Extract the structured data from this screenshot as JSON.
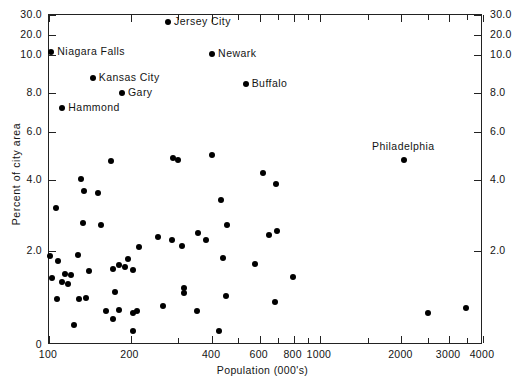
{
  "chart_data": {
    "type": "scatter",
    "title": "",
    "xlabel": "Population (000's)",
    "ylabel": "Percent of city area",
    "xscale": "log",
    "xlim": [
      100,
      4000
    ],
    "ylim": [
      0,
      30
    ],
    "grid": false,
    "legend": null,
    "x_ticks_labeled": [
      100,
      200,
      400,
      600,
      800,
      1000,
      2000,
      3000,
      4000
    ],
    "x_ticks_minor": [
      300,
      500,
      700,
      900,
      1500,
      2500,
      3500
    ],
    "y_ticks_labeled": [
      "0",
      "2.0",
      "4.0",
      "6.0",
      "8.0",
      "10.0",
      "20.0",
      "30.0"
    ],
    "y_tick_values": [
      0,
      2,
      4,
      6,
      8,
      10,
      20,
      30
    ],
    "y_axis_note": "compressed non-linear scale above 8.0",
    "labeled_points": [
      {
        "label": "Jersey City",
        "x": 275,
        "y": 26.5,
        "label_pos": "right"
      },
      {
        "label": "Niagara Falls",
        "x": 102,
        "y": 11.2,
        "label_pos": "right"
      },
      {
        "label": "Newark",
        "x": 400,
        "y": 10.2,
        "label_pos": "right"
      },
      {
        "label": "Kansas City",
        "x": 145,
        "y": 8.75,
        "label_pos": "right"
      },
      {
        "label": "Buffalo",
        "x": 532,
        "y": 8.45,
        "label_pos": "right"
      },
      {
        "label": "Gary",
        "x": 186,
        "y": 8.0,
        "label_pos": "right"
      },
      {
        "label": "Hammond",
        "x": 112,
        "y": 7.2,
        "label_pos": "right"
      },
      {
        "label": "Philadelphia",
        "x": 2050,
        "y": 4.85,
        "label_pos": "above"
      }
    ],
    "unlabeled_points": [
      {
        "x": 169,
        "y": 4.8
      },
      {
        "x": 286,
        "y": 4.9
      },
      {
        "x": 299,
        "y": 4.85
      },
      {
        "x": 398,
        "y": 5.05
      },
      {
        "x": 614,
        "y": 4.3
      },
      {
        "x": 131,
        "y": 4.05
      },
      {
        "x": 690,
        "y": 3.9
      },
      {
        "x": 430,
        "y": 3.45
      },
      {
        "x": 135,
        "y": 3.7
      },
      {
        "x": 152,
        "y": 3.62
      },
      {
        "x": 106,
        "y": 3.2
      },
      {
        "x": 133,
        "y": 2.8
      },
      {
        "x": 155,
        "y": 2.72
      },
      {
        "x": 453,
        "y": 2.72
      },
      {
        "x": 692,
        "y": 2.55
      },
      {
        "x": 355,
        "y": 2.5
      },
      {
        "x": 252,
        "y": 2.4
      },
      {
        "x": 284,
        "y": 2.3
      },
      {
        "x": 380,
        "y": 2.32
      },
      {
        "x": 650,
        "y": 2.45
      },
      {
        "x": 310,
        "y": 2.15
      },
      {
        "x": 215,
        "y": 2.1
      },
      {
        "x": 101,
        "y": 1.9
      },
      {
        "x": 128,
        "y": 1.92
      },
      {
        "x": 437,
        "y": 1.85
      },
      {
        "x": 108,
        "y": 1.78
      },
      {
        "x": 196,
        "y": 1.82
      },
      {
        "x": 575,
        "y": 1.72
      },
      {
        "x": 181,
        "y": 1.7
      },
      {
        "x": 190,
        "y": 1.65
      },
      {
        "x": 204,
        "y": 1.6
      },
      {
        "x": 172,
        "y": 1.62
      },
      {
        "x": 141,
        "y": 1.58
      },
      {
        "x": 795,
        "y": 1.45
      },
      {
        "x": 115,
        "y": 1.5
      },
      {
        "x": 121,
        "y": 1.48
      },
      {
        "x": 103,
        "y": 1.42
      },
      {
        "x": 112,
        "y": 1.35
      },
      {
        "x": 118,
        "y": 1.3
      },
      {
        "x": 175,
        "y": 1.12
      },
      {
        "x": 314,
        "y": 1.22
      },
      {
        "x": 316,
        "y": 1.1
      },
      {
        "x": 452,
        "y": 1.05
      },
      {
        "x": 107,
        "y": 0.98
      },
      {
        "x": 129,
        "y": 0.98
      },
      {
        "x": 137,
        "y": 1.0
      },
      {
        "x": 680,
        "y": 0.92
      },
      {
        "x": 162,
        "y": 0.72
      },
      {
        "x": 181,
        "y": 0.75
      },
      {
        "x": 211,
        "y": 0.72
      },
      {
        "x": 205,
        "y": 0.68
      },
      {
        "x": 264,
        "y": 0.82
      },
      {
        "x": 351,
        "y": 0.72
      },
      {
        "x": 124,
        "y": 0.42
      },
      {
        "x": 172,
        "y": 0.55
      },
      {
        "x": 204,
        "y": 0.3
      },
      {
        "x": 424,
        "y": 0.3
      },
      {
        "x": 2500,
        "y": 0.68
      },
      {
        "x": 3450,
        "y": 0.78
      }
    ]
  }
}
